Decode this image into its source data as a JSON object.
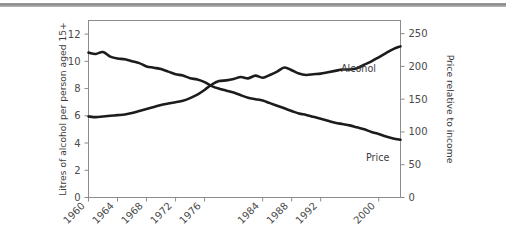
{
  "figure": {
    "background_color": "#ffffff",
    "line_color": "#1c1c1c",
    "axis_color": "#8d8d8d",
    "top_rule_color": "#8c8c8c"
  },
  "chart_data": {
    "type": "line",
    "title": "",
    "xlabel": "",
    "ylabel": "Litres of alcohol per person aged 15+",
    "y2label": "Price relative to income",
    "grid": false,
    "legend": "inline-labels",
    "xlim": [
      1960,
      2003
    ],
    "ylim": [
      0,
      13
    ],
    "y2lim": [
      0,
      270
    ],
    "xticks": [
      1960,
      1964,
      1968,
      1972,
      1976,
      1984,
      1988,
      1992,
      2000
    ],
    "xtick_labels": [
      "1960",
      "1964",
      "1968",
      "1972",
      "1976",
      "1984",
      "1988",
      "1992",
      "2000"
    ],
    "yticks": [
      0,
      2,
      4,
      6,
      8,
      10,
      12
    ],
    "ytick_labels": [
      "0",
      "2",
      "4",
      "6",
      "8",
      "10",
      "12"
    ],
    "y2ticks": [
      0,
      50,
      100,
      150,
      200,
      250
    ],
    "y2tick_labels": [
      "0",
      "50",
      "100",
      "150",
      "200",
      "250"
    ],
    "series": [
      {
        "name": "Alcohol",
        "axis": "left",
        "label": "Alcohol",
        "x": [
          1960,
          1961,
          1962,
          1963,
          1964,
          1965,
          1966,
          1967,
          1968,
          1969,
          1970,
          1971,
          1972,
          1973,
          1974,
          1975,
          1976,
          1977,
          1978,
          1979,
          1980,
          1981,
          1982,
          1983,
          1984,
          1985,
          1986,
          1987,
          1988,
          1989,
          1990,
          1991,
          1992,
          1993,
          1994,
          1995,
          1996,
          1997,
          1998,
          1999,
          2000,
          2001,
          2002,
          2003
        ],
        "values": [
          5.95,
          5.9,
          5.95,
          6.0,
          6.05,
          6.1,
          6.2,
          6.35,
          6.5,
          6.65,
          6.8,
          6.9,
          7.0,
          7.1,
          7.3,
          7.55,
          7.9,
          8.3,
          8.55,
          8.6,
          8.7,
          8.85,
          8.75,
          8.95,
          8.8,
          9.0,
          9.25,
          9.55,
          9.35,
          9.1,
          9.0,
          9.05,
          9.1,
          9.2,
          9.3,
          9.4,
          9.4,
          9.5,
          9.75,
          10.0,
          10.3,
          10.6,
          10.9,
          11.1
        ]
      },
      {
        "name": "Price",
        "axis": "right",
        "label": "Price",
        "x": [
          1960,
          1961,
          1962,
          1963,
          1964,
          1965,
          1966,
          1967,
          1968,
          1969,
          1970,
          1971,
          1972,
          1973,
          1974,
          1975,
          1976,
          1977,
          1978,
          1979,
          1980,
          1981,
          1982,
          1983,
          1984,
          1985,
          1986,
          1987,
          1988,
          1989,
          1990,
          1991,
          1992,
          1993,
          1994,
          1995,
          1996,
          1997,
          1998,
          1999,
          2000,
          2001,
          2002,
          2003
        ],
        "values": [
          221,
          219,
          222,
          215,
          212,
          211,
          208,
          205,
          200,
          198,
          196,
          192,
          188,
          186,
          182,
          180,
          176,
          170,
          166,
          163,
          160,
          156,
          152,
          150,
          148,
          144,
          140,
          136,
          132,
          128,
          126,
          123,
          120,
          117,
          114,
          112,
          110,
          107,
          104,
          100,
          97,
          93,
          90,
          88
        ]
      }
    ]
  }
}
